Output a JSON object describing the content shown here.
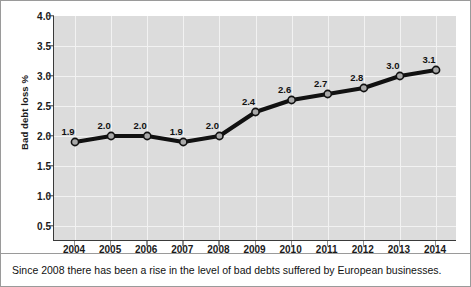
{
  "chart_data": {
    "type": "line",
    "title": "",
    "xlabel": "",
    "ylabel": "Bad debt loss %",
    "categories": [
      "2004",
      "2005",
      "2006",
      "2007",
      "2008",
      "2009",
      "2010",
      "2011",
      "2012",
      "2013",
      "2014"
    ],
    "values": [
      1.9,
      2.0,
      2.0,
      1.9,
      2.0,
      2.4,
      2.6,
      2.7,
      2.8,
      3.0,
      3.1
    ],
    "point_labels": [
      "1.9",
      "2.0",
      "2.0",
      "1.9",
      "2.0",
      "2.4",
      "2.6",
      "2.7",
      "2.8",
      "3.0",
      "3.1"
    ],
    "ylim": [
      0.25,
      4.0
    ],
    "yticks": [
      4.0,
      3.5,
      3.0,
      2.5,
      2.0,
      1.5,
      1.0,
      0.5
    ],
    "ytick_labels": [
      "4.0",
      "3.5",
      "3.0",
      "2.5",
      "2.0",
      "1.5",
      "1.0",
      "0.5"
    ],
    "grid": true,
    "legend": "none",
    "series_color": "#111111",
    "marker_fill": "#a8a8a8",
    "marker_edge": "#111111",
    "plot_background": "#dcdcdc",
    "gridline_color": "#f2f2f2"
  },
  "caption": {
    "text": "Since 2008 there has been a rise in the level of bad debts suffered by European businesses."
  }
}
